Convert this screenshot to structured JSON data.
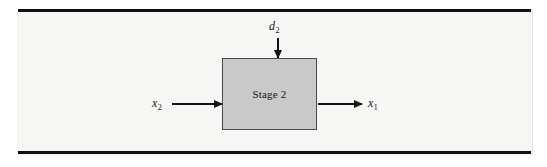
{
  "figure": {
    "name": "stage-2-block-diagram",
    "background_color": "#f6f6f5",
    "rule_color": "#101010",
    "block": {
      "label": "Stage 2",
      "fill_color": "#c9c9c9",
      "border_color": "#4a4a4a"
    },
    "signals": {
      "input_left": {
        "symbol": "x",
        "subscript": "2",
        "direction": "right",
        "role": "input"
      },
      "output_right": {
        "symbol": "x",
        "subscript": "1",
        "direction": "right",
        "role": "output"
      },
      "disturbance_top": {
        "symbol": "d",
        "subscript": "2",
        "direction": "down",
        "role": "disturbance"
      }
    },
    "arrow_color": "#121212"
  }
}
